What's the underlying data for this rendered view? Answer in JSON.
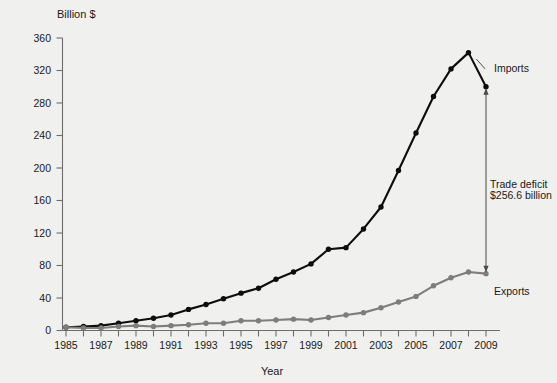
{
  "chart_data": {
    "type": "line",
    "title": "",
    "xlabel": "Year",
    "ylabel": "Billion $",
    "ylabel_display": "Billion $",
    "x": [
      1985,
      1986,
      1987,
      1988,
      1989,
      1990,
      1991,
      1992,
      1993,
      1994,
      1995,
      1996,
      1997,
      1998,
      1999,
      2000,
      2001,
      2002,
      2003,
      2004,
      2005,
      2006,
      2007,
      2008,
      2009
    ],
    "xlim": [
      1985,
      2009
    ],
    "ylim": [
      0,
      360
    ],
    "yticks": [
      0,
      40,
      80,
      120,
      160,
      200,
      240,
      280,
      320,
      360
    ],
    "xticks": [
      1985,
      1987,
      1989,
      1991,
      1993,
      1995,
      1997,
      1999,
      2001,
      2003,
      2005,
      2007,
      2009
    ],
    "grid": false,
    "legend": "none",
    "series": [
      {
        "name": "Imports",
        "color": "#0d0d0d",
        "marker": "circle",
        "values": [
          4,
          5,
          6,
          9,
          12,
          15,
          19,
          26,
          32,
          39,
          46,
          52,
          63,
          72,
          82,
          100,
          102,
          125,
          152,
          197,
          243,
          288,
          322,
          342,
          300
        ]
      },
      {
        "name": "Exports",
        "color": "#7d7d7d",
        "marker": "circle",
        "values": [
          4,
          3,
          3,
          5,
          6,
          5,
          6,
          7,
          9,
          9,
          12,
          12,
          13,
          14,
          13,
          16,
          19,
          22,
          28,
          35,
          42,
          55,
          65,
          72,
          70
        ]
      }
    ],
    "annotations": [
      {
        "name": "imports-label",
        "text": "Imports",
        "x": 2009,
        "y": 320
      },
      {
        "name": "exports-label",
        "text": "Exports",
        "x": 2009,
        "y": 44
      },
      {
        "name": "deficit-label-line1",
        "text": "Trade deficit",
        "x": 2008,
        "y": 176
      },
      {
        "name": "deficit-label-line2",
        "text": "$256.6 billion",
        "x": 2008,
        "y": 162
      }
    ],
    "deficit": {
      "label_line1": "Trade deficit",
      "label_line2": "$256.6 billion",
      "value": 256.6,
      "unit": "billion",
      "currency": "$",
      "year": 2009,
      "top": 300,
      "bottom": 70
    }
  },
  "axes": {
    "y_title": "Billion $",
    "x_title": "Year",
    "y_tick_labels": [
      "360",
      "320",
      "280",
      "240",
      "200",
      "160",
      "120",
      "80",
      "40",
      "0"
    ],
    "x_tick_labels": [
      "1985",
      "1987",
      "1989",
      "1991",
      "1993",
      "1995",
      "1997",
      "1999",
      "2001",
      "2003",
      "2005",
      "2007",
      "2009"
    ]
  },
  "labels": {
    "imports": "Imports",
    "exports": "Exports",
    "deficit_1": "Trade deficit",
    "deficit_2": "$256.6 billion"
  },
  "colors": {
    "background": "#f0f0ee",
    "imports": "#0d0d0d",
    "exports": "#7d7d7d",
    "axis": "#6e6e6e",
    "text": "#1a1a1a"
  }
}
